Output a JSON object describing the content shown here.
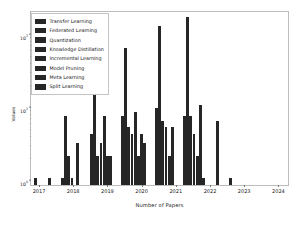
{
  "chart_data": {
    "type": "bar",
    "title": "",
    "xlabel": "Number of Papers",
    "ylabel": "Values",
    "yscale": "log",
    "ylim": [
      0.8,
      200
    ],
    "grid": false,
    "legend_position": "upper left",
    "y_ticks": [
      "10^0",
      "10^1",
      "10^2"
    ],
    "y_tick_labels": [
      "10",
      "10",
      "10"
    ],
    "y_tick_exponents": [
      "0",
      "1",
      "2"
    ],
    "categories": [
      "2017",
      "2018",
      "2019",
      "2020",
      "2021",
      "2022",
      "2023",
      "2024"
    ],
    "x_tick_labels": [
      "2017",
      "2018",
      "2019",
      "2020",
      "2021",
      "2022",
      "2023",
      "2024"
    ],
    "series": [
      {
        "name": "Transfer Learning",
        "color": "#262626",
        "values": [
          1,
          1,
          1,
          4,
          7,
          9,
          7,
          0
        ]
      },
      {
        "name": "Federated Learning",
        "color": "#262626",
        "values": [
          0,
          0,
          7,
          22,
          60,
          120,
          160,
          0
        ]
      },
      {
        "name": "Quantization",
        "color": "#262626",
        "values": [
          0,
          0,
          2,
          2,
          5,
          6,
          7,
          0
        ]
      },
      {
        "name": "Knowledge Distillation",
        "color": "#262626",
        "values": [
          0,
          0,
          1,
          3,
          4,
          5,
          4,
          0
        ]
      },
      {
        "name": "Incremental Learning",
        "color": "#262626",
        "values": [
          0,
          0,
          0,
          7,
          8,
          2,
          2,
          0
        ]
      },
      {
        "name": "Model Pruning",
        "color": "#262626",
        "values": [
          0,
          0,
          3,
          2,
          4,
          5,
          10,
          6
        ]
      },
      {
        "name": "Meta Learning",
        "color": "#262626",
        "values": [
          0,
          0,
          0,
          2,
          3,
          0,
          1,
          1
        ]
      },
      {
        "name": "Split Learning",
        "color": "#262626",
        "values": [
          0,
          0,
          0,
          0,
          3,
          0,
          0,
          0
        ]
      }
    ],
    "bars": [
      {
        "x": 3.0,
        "h": 1,
        "series": "Transfer Learning"
      },
      {
        "x": 17.0,
        "h": 1,
        "series": "Transfer Learning"
      },
      {
        "x": 30.0,
        "h": 1,
        "series": "Transfer Learning"
      },
      {
        "x": 33.2,
        "h": 7,
        "series": "Federated Learning"
      },
      {
        "x": 36.4,
        "h": 2,
        "series": "Quantization"
      },
      {
        "x": 39.6,
        "h": 1,
        "series": "Knowledge Distillation"
      },
      {
        "x": 45.0,
        "h": 3,
        "series": "Model Pruning"
      },
      {
        "x": 59.0,
        "h": 4,
        "series": "Transfer Learning"
      },
      {
        "x": 62.2,
        "h": 22,
        "series": "Federated Learning"
      },
      {
        "x": 65.4,
        "h": 2,
        "series": "Quantization"
      },
      {
        "x": 68.6,
        "h": 3,
        "series": "Knowledge Distillation"
      },
      {
        "x": 71.8,
        "h": 7,
        "series": "Incremental Learning"
      },
      {
        "x": 75.0,
        "h": 2,
        "series": "Model Pruning"
      },
      {
        "x": 78.2,
        "h": 2,
        "series": "Meta Learning"
      },
      {
        "x": 90.0,
        "h": 7,
        "series": "Transfer Learning"
      },
      {
        "x": 93.2,
        "h": 60,
        "series": "Federated Learning"
      },
      {
        "x": 96.4,
        "h": 5,
        "series": "Quantization"
      },
      {
        "x": 99.6,
        "h": 4,
        "series": "Knowledge Distillation"
      },
      {
        "x": 102.8,
        "h": 8,
        "series": "Incremental Learning"
      },
      {
        "x": 106.0,
        "h": 2,
        "series": "Model Pruning"
      },
      {
        "x": 109.2,
        "h": 4,
        "series": "Meta Learning"
      },
      {
        "x": 112.4,
        "h": 3,
        "series": "Split Learning"
      },
      {
        "x": 124.0,
        "h": 9,
        "series": "Transfer Learning"
      },
      {
        "x": 127.2,
        "h": 120,
        "series": "Federated Learning"
      },
      {
        "x": 130.4,
        "h": 6,
        "series": "Quantization"
      },
      {
        "x": 133.6,
        "h": 5,
        "series": "Knowledge Distillation"
      },
      {
        "x": 136.8,
        "h": 2,
        "series": "Incremental Learning"
      },
      {
        "x": 140.0,
        "h": 5,
        "series": "Model Pruning"
      },
      {
        "x": 152.0,
        "h": 7,
        "series": "Transfer Learning"
      },
      {
        "x": 155.2,
        "h": 160,
        "series": "Federated Learning"
      },
      {
        "x": 158.4,
        "h": 7,
        "series": "Quantization"
      },
      {
        "x": 161.6,
        "h": 4,
        "series": "Knowledge Distillation"
      },
      {
        "x": 164.8,
        "h": 2,
        "series": "Incremental Learning"
      },
      {
        "x": 168.0,
        "h": 10,
        "series": "Model Pruning"
      },
      {
        "x": 171.2,
        "h": 1,
        "series": "Meta Learning"
      },
      {
        "x": 185.0,
        "h": 6,
        "series": "Model Pruning"
      },
      {
        "x": 198.0,
        "h": 1,
        "series": "Meta Learning"
      }
    ]
  },
  "legend": {
    "items": [
      {
        "label": "Transfer Learning"
      },
      {
        "label": "Federated Learning"
      },
      {
        "label": "Quantization"
      },
      {
        "label": "Knowledge Distillation"
      },
      {
        "label": "Incremental Learning"
      },
      {
        "label": "Model Pruning"
      },
      {
        "label": "Meta Learning"
      },
      {
        "label": "Split Learning"
      }
    ]
  }
}
